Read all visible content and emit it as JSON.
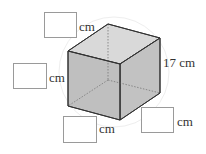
{
  "figure": {
    "type": "cube",
    "edge_label": "17 cm",
    "colors": {
      "front_face": "#b4b4b4",
      "top_face": "#d9d9d9",
      "side_face": "#c2c2c2",
      "edge": "#333333",
      "hidden_edge": "#777777"
    }
  },
  "answer_boxes": [
    {
      "unit": "cm",
      "value": ""
    },
    {
      "unit": "cm",
      "value": ""
    },
    {
      "unit": "cm",
      "value": ""
    },
    {
      "unit": "cm",
      "value": ""
    }
  ]
}
